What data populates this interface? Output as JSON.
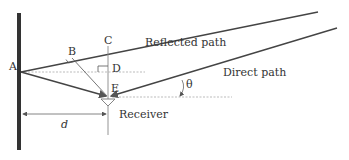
{
  "diagram": {
    "type": "geometric ray diagram",
    "labels": {
      "point_a": "A",
      "point_b": "B",
      "point_c": "C",
      "point_d": "D",
      "point_e": "E",
      "reflected_path": "Reflected path",
      "direct_path": "Direct path",
      "angle": "θ",
      "receiver": "Receiver",
      "distance": "d"
    },
    "colors": {
      "wall": "#333333",
      "lines": "#444444",
      "thin_lines": "#777777",
      "dashed": "#aaaaaa",
      "text": "#333333"
    }
  }
}
